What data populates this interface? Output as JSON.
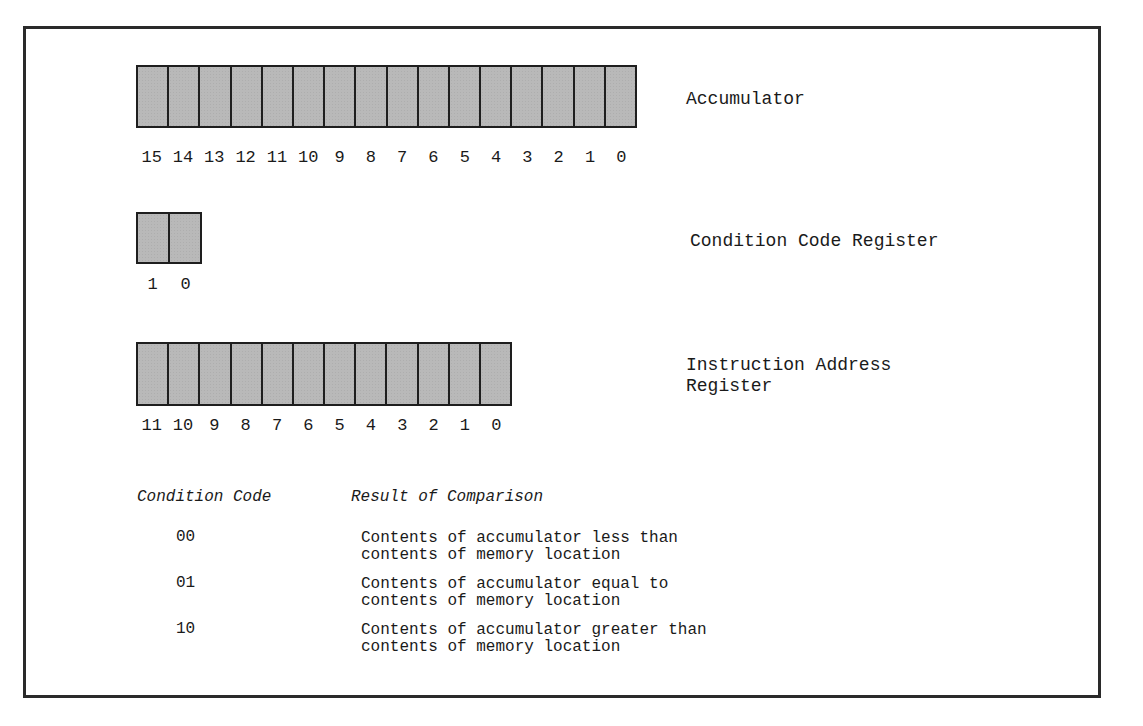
{
  "registers": [
    {
      "name": "Accumulator",
      "bits": [
        "15",
        "14",
        "13",
        "12",
        "11",
        "10",
        "9",
        "8",
        "7",
        "6",
        "5",
        "4",
        "3",
        "2",
        "1",
        "0"
      ]
    },
    {
      "name": "Condition Code Register",
      "bits": [
        "1",
        "0"
      ]
    },
    {
      "name": "Instruction Address\nRegister",
      "bits": [
        "11",
        "10",
        "9",
        "8",
        "7",
        "6",
        "5",
        "4",
        "3",
        "2",
        "1",
        "0"
      ]
    }
  ],
  "table": {
    "headers": [
      "Condition Code",
      "Result of Comparison"
    ],
    "rows": [
      {
        "code": "00",
        "result": "Contents of accumulator less than\ncontents of memory location"
      },
      {
        "code": "01",
        "result": "Contents of accumulator equal to\ncontents of memory location"
      },
      {
        "code": "10",
        "result": "Contents of accumulator greater than\ncontents of memory location"
      }
    ]
  },
  "colors": {
    "cell_fill": "#b9b9b9",
    "border": "#1e1e1e"
  }
}
